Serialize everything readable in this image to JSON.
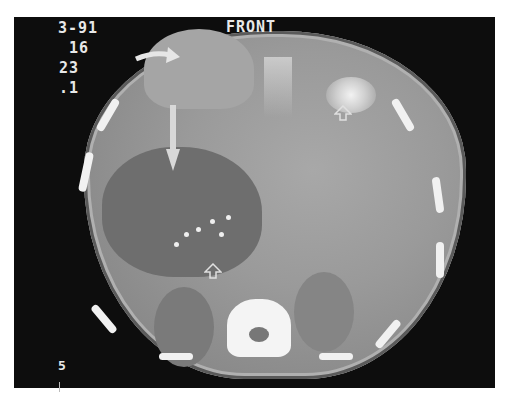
{
  "image": {
    "type": "axial CT scan of abdomen",
    "orientation_label": "FRONT",
    "overlay_text": {
      "line1": "3-91",
      "line2": "16",
      "line3": "23",
      "line4": ".1",
      "bottom_left": "5"
    },
    "annotations": [
      {
        "kind": "curved-arrow",
        "target": "anterior abdominal wall bulge"
      },
      {
        "kind": "straight-arrow",
        "target": "large hypodense hepatic mass"
      },
      {
        "kind": "open-arrow",
        "target": "bright enhancing focus (upper right)"
      },
      {
        "kind": "open-arrow",
        "target": "calcifications near vertebra"
      }
    ],
    "colors": {
      "background": "#0d0d0d",
      "soft_tissue": "#9a9a9a",
      "mass": "#6e6e6e",
      "bone": "#f4f4f4",
      "text": "#e8e8e8"
    }
  }
}
